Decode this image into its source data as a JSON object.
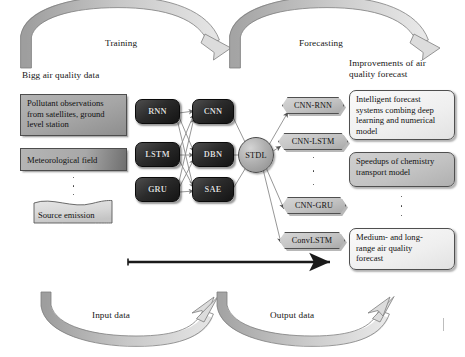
{
  "arcs": {
    "training_label": "Training",
    "forecasting_label": "Forecasting",
    "input_label": "Input data",
    "output_label": "Output data"
  },
  "headings": {
    "left": "Bigg air quality data",
    "right": "Improvements of air\nquality forecast"
  },
  "inputs": {
    "boxes": [
      {
        "label": "Pollutant observations\nfrom satellites, ground\nlevel station"
      },
      {
        "label": "Meteorological field"
      }
    ],
    "document": {
      "label": "Source emission"
    },
    "ellipsis_dots": 3
  },
  "models": {
    "column_one": [
      {
        "label": "RNN"
      },
      {
        "label": "LSTM"
      },
      {
        "label": "GRU"
      }
    ],
    "column_two": [
      {
        "label": "CNN"
      },
      {
        "label": "DBN"
      },
      {
        "label": "SAE"
      }
    ],
    "hub": {
      "label": "STDL"
    }
  },
  "hybrids": [
    {
      "label": "CNN-RNN"
    },
    {
      "label": "CNN-LSTM"
    },
    {
      "label": "CNN-GRU"
    },
    {
      "label": "ConvLSTM"
    }
  ],
  "outcomes": [
    {
      "label": "Intelligent forecast\nsystems combing deep\nlearning and numerical\nmodel",
      "style": "light"
    },
    {
      "label": "Speedups of chemistry\ntransport model",
      "style": "shaded"
    },
    {
      "label": "Medium- and long-\nrange air quality\nforecast",
      "style": "light"
    }
  ],
  "colors": {
    "model_block": "#1f1f1f",
    "data_block": "#a9a9a9",
    "hexagon": "#c4c4c4",
    "arc_arrow": "#b8b8b8",
    "flow_arrow": "#1a1a1a"
  }
}
